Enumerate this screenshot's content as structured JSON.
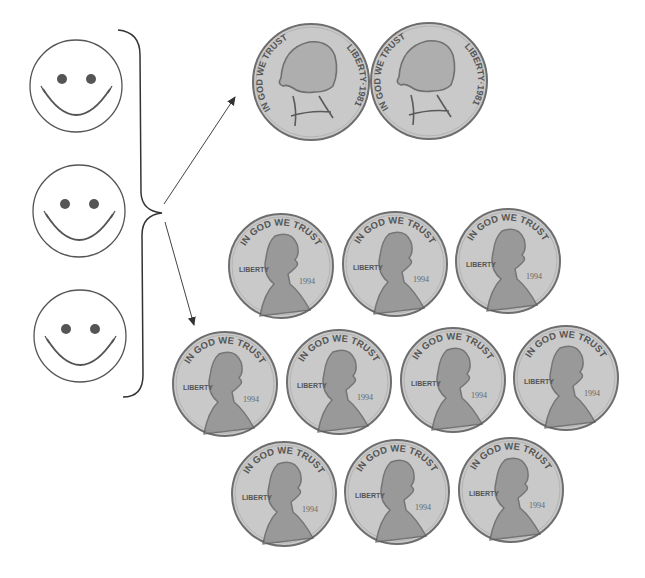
{
  "figure": {
    "people": {
      "count": 3,
      "items": [
        {
          "label": "smiley-face",
          "cx": 76,
          "cy": 86,
          "r": 46
        },
        {
          "label": "smiley-face",
          "cx": 79,
          "cy": 211,
          "r": 46
        },
        {
          "label": "smiley-face",
          "cx": 80,
          "cy": 336,
          "r": 46
        }
      ]
    },
    "brace": {
      "x": 140,
      "top": 30,
      "bottom": 397,
      "tip_y": 213
    },
    "arrows": [
      {
        "name": "arrow-to-nickels",
        "x1": 164,
        "y1": 204,
        "x2": 235,
        "y2": 97
      },
      {
        "name": "arrow-to-pennies",
        "x1": 165,
        "y1": 222,
        "x2": 194,
        "y2": 325
      }
    ],
    "nickels": {
      "count": 2,
      "motto": "IN GOD WE TRUST",
      "liberty": "LIBERTY",
      "year": "1981",
      "items": [
        {
          "cx": 311,
          "cy": 82,
          "r": 58
        },
        {
          "cx": 429,
          "cy": 81,
          "r": 58
        }
      ]
    },
    "pennies": {
      "count": 10,
      "motto": "IN GOD WE TRUST",
      "liberty": "LIBERTY",
      "year": "1994",
      "items": [
        {
          "cx": 281,
          "cy": 266,
          "r": 52
        },
        {
          "cx": 395,
          "cy": 264,
          "r": 52
        },
        {
          "cx": 508,
          "cy": 261,
          "r": 52
        },
        {
          "cx": 225,
          "cy": 384,
          "r": 52
        },
        {
          "cx": 339,
          "cy": 382,
          "r": 52
        },
        {
          "cx": 453,
          "cy": 380,
          "r": 52
        },
        {
          "cx": 566,
          "cy": 378,
          "r": 52
        },
        {
          "cx": 284,
          "cy": 494,
          "r": 52
        },
        {
          "cx": 397,
          "cy": 492,
          "r": 52
        },
        {
          "cx": 511,
          "cy": 490,
          "r": 52
        }
      ]
    },
    "colors": {
      "line": "#555555",
      "coin_fill": "#c9c9c9",
      "coin_rim": "#6e6e6e",
      "eye": "#555555"
    }
  }
}
